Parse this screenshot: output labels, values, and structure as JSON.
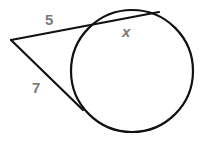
{
  "diagram": {
    "type": "secant-tangent",
    "labels": {
      "secant_external": "5",
      "secant_internal": "x",
      "tangent": "7"
    },
    "colors": {
      "stroke": "#111111",
      "label": "#7a7a7a"
    }
  }
}
